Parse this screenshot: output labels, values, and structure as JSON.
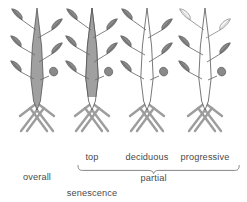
{
  "figure": {
    "title_absent": true,
    "palette": {
      "background": "#ffffff",
      "stem_gray": "#a0a0a0",
      "stem_white": "#ffffff",
      "leaf_gray": "#8a8a8a",
      "leaf_white": "#f2f2f2",
      "outline": "#555555",
      "text": "#4a4a4a",
      "brace": "#6e6e6e"
    },
    "plants": [
      {
        "id": "plant-overall",
        "label": "overall",
        "stem_shading": "full",
        "leaf_shading": "all-gray",
        "center_x": 37
      },
      {
        "id": "plant-top",
        "label": "top",
        "stem_shading": "upper-only",
        "leaf_shading": "all-gray",
        "center_x": 92
      },
      {
        "id": "plant-deciduous",
        "label": "deciduous",
        "stem_shading": "none",
        "leaf_shading": "all-gray",
        "center_x": 147
      },
      {
        "id": "plant-progressive",
        "label": "progressive",
        "stem_shading": "none",
        "leaf_shading": "top-white-lower-gray",
        "center_x": 205
      }
    ],
    "labels": {
      "overall": "overall",
      "top": "top",
      "deciduous": "deciduous",
      "progressive": "progressive",
      "partial": "partial",
      "senescence": "senescence"
    },
    "brace": {
      "spans_labels": [
        "top",
        "deciduous",
        "progressive"
      ],
      "groups_into": "partial"
    }
  }
}
